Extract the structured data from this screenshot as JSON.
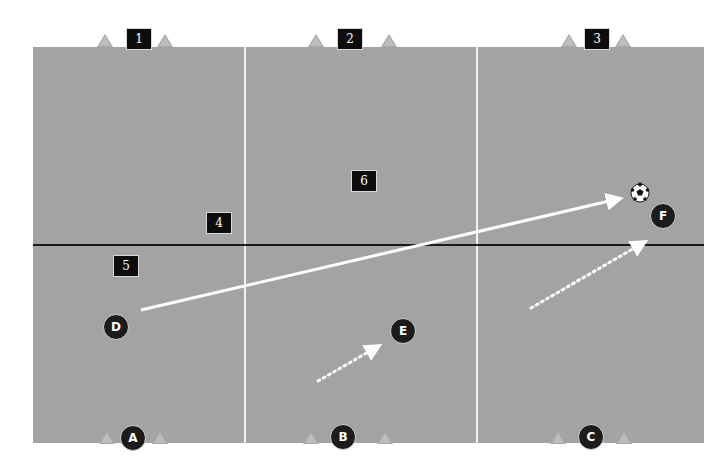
{
  "diagram": {
    "type": "soccer-drill",
    "colors": {
      "field": "#a3a3a3",
      "zone_line": "#f2f2f2",
      "half_line": "#1a1a1a",
      "marker": "#0d0d0d",
      "player": "#1c1c1c",
      "arrow": "#ffffff"
    },
    "zone_labels": [
      {
        "id": "1",
        "label": "1"
      },
      {
        "id": "2",
        "label": "2"
      },
      {
        "id": "3",
        "label": "3"
      },
      {
        "id": "4",
        "label": "4"
      },
      {
        "id": "5",
        "label": "5"
      },
      {
        "id": "6",
        "label": "6"
      }
    ],
    "players": [
      {
        "id": "A",
        "label": "A"
      },
      {
        "id": "B",
        "label": "B"
      },
      {
        "id": "C",
        "label": "C"
      },
      {
        "id": "D",
        "label": "D"
      },
      {
        "id": "E",
        "label": "E"
      },
      {
        "id": "F",
        "label": "F"
      }
    ],
    "ball": {
      "icon": "soccer-ball-icon",
      "near": "F"
    },
    "movements": [
      {
        "from": "D",
        "to": "F",
        "style": "solid",
        "meaning": "pass"
      },
      {
        "from": "B-area",
        "to": "E",
        "style": "dotted",
        "meaning": "run"
      },
      {
        "from": "C-area",
        "to": "F",
        "style": "dotted",
        "meaning": "run"
      }
    ]
  }
}
